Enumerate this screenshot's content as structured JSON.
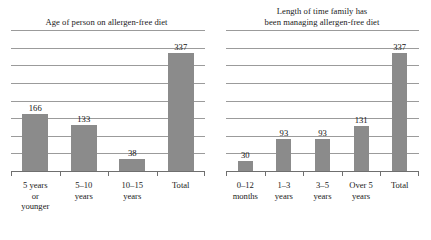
{
  "figure": {
    "background_color": "#ffffff",
    "bar_color": "#8b8b8b",
    "gridline_color": "#9b9b9b",
    "text_color": "#1a1a1a"
  },
  "chart_data": [
    {
      "type": "bar",
      "title": "Age of person on allergen-free diet",
      "categories": [
        "5 years\nor\nyounger",
        "5–10\nyears",
        "10–15\nyears",
        "Total"
      ],
      "values": [
        166,
        133,
        38,
        337
      ],
      "value_labels": [
        "166",
        "133",
        "38",
        "337"
      ],
      "xlabel": "",
      "ylabel": "",
      "ylim": [
        0,
        400
      ],
      "ytick_step": 50,
      "gridlines": 8,
      "grid": true,
      "ytick_labels_visible": false,
      "legend": false
    },
    {
      "type": "bar",
      "title": "Length of time family has\nbeen managing allergen-free diet",
      "categories": [
        "0–12\nmonths",
        "1–3\nyears",
        "3–5\nyears",
        "Over 5\nyears",
        "Total"
      ],
      "values": [
        30,
        93,
        93,
        131,
        337
      ],
      "value_labels": [
        "30",
        "93",
        "93",
        "131",
        "337"
      ],
      "xlabel": "",
      "ylabel": "",
      "ylim": [
        0,
        400
      ],
      "ytick_step": 50,
      "gridlines": 8,
      "grid": true,
      "ytick_labels_visible": false,
      "legend": false
    }
  ]
}
